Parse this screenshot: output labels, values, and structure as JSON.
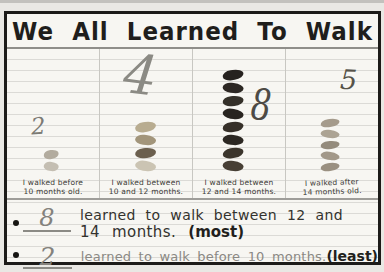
{
  "title": "We All Learned To Walk",
  "chart_data": {
    "type": "bar",
    "title": "We All Learned To Walk",
    "style": "hand-drawn classroom pictograph, one crayon mark per student",
    "categories": [
      "I walked before 10 months old.",
      "I walked between 10 and 12 months.",
      "I walked between 12 and 14 months.",
      "I walked after 14 months old."
    ],
    "values": [
      2,
      4,
      8,
      5
    ],
    "ylim": [
      0,
      8
    ],
    "legend": "none",
    "columns": [
      {
        "number": "2",
        "count": 2,
        "label_line1": "I walked before",
        "label_line2": "10 months old.",
        "blob_colors": [
          "#b2ab9e",
          "#c4beb2"
        ]
      },
      {
        "number": "4",
        "count": 4,
        "label_line1": "I walked between",
        "label_line2": "10 and 12 months.",
        "blob_colors": [
          "#b8ac90",
          "#a2957b",
          "#6b5f4e",
          "#cbc4b3"
        ]
      },
      {
        "number": "8",
        "count": 8,
        "label_line1": "I walked between",
        "label_line2": "12 and 14 months.",
        "blob_colors": [
          "#26221f",
          "#2c2723",
          "#343029",
          "#282420",
          "#363029",
          "#2c2823",
          "#3b352c",
          "#473f35"
        ]
      },
      {
        "number": "5",
        "count": 5,
        "label_line1": "I walked after",
        "label_line2": "14 months old.",
        "blob_colors": [
          "#a59b8c",
          "#aca393",
          "#948b7c",
          "#a29889",
          "#9a9081"
        ]
      }
    ]
  },
  "footer": {
    "notes": [
      {
        "number": "8",
        "line1": "learned to walk between 12 and",
        "line2": "14 months.",
        "emphasis": "(most)"
      },
      {
        "number": "2",
        "line1": "learned to walk before 10 months.",
        "emphasis": "(least)"
      }
    ]
  },
  "colors": {
    "paper": "#f7f6f2",
    "rule_line": "#dbdad6",
    "frame": "#1c1b19",
    "pencil_gray": "#84827d",
    "marker_ink": "#33322e"
  }
}
